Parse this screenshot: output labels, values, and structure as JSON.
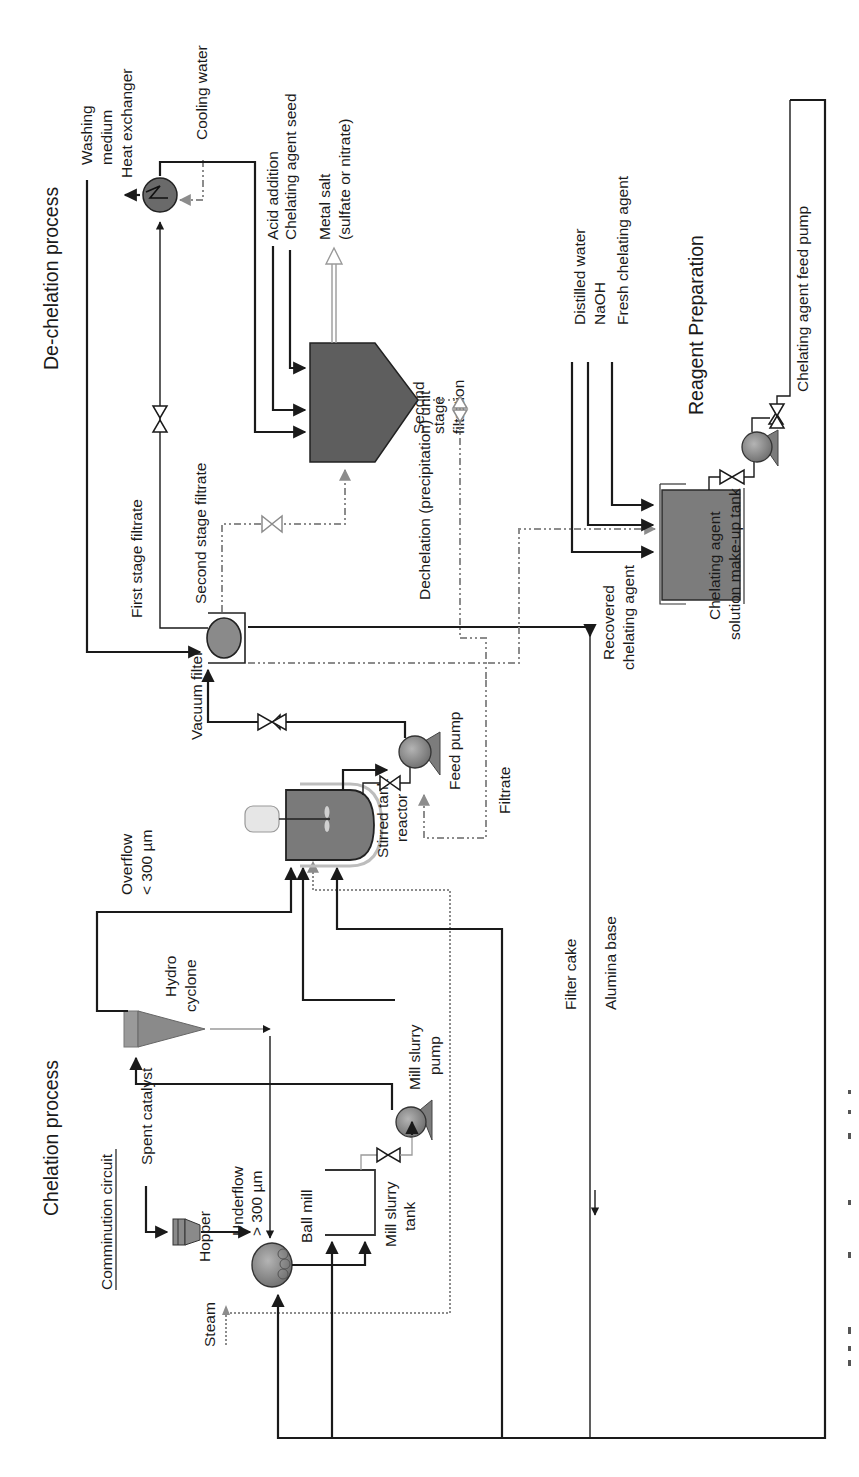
{
  "figure": {
    "orientation": "rotated-90-ccw",
    "sections": {
      "chelation_title": "Chelation process",
      "dechelation_title": "De-chelation process",
      "reagent_title": "Reagent Preparation",
      "comminution_title": "Comminution circuit"
    },
    "equipment": {
      "hopper": "Hopper",
      "ball_mill": "Ball mill",
      "mill_slurry_tank": [
        "Mill slurry",
        "tank"
      ],
      "mill_slurry_pump": [
        "Mill slurry",
        "pump"
      ],
      "hydro_cyclone": [
        "Hydro",
        "cyclone"
      ],
      "stirred_tank_reactor": [
        "Stirred tank",
        "reactor"
      ],
      "feed_pump": "Feed pump",
      "vacuum_filter": "Vacuum filter",
      "heat_exchanger": "Heat exchanger",
      "dechelation_unit": "Dechelation (precipitation) unit",
      "makeup_tank": [
        "Chelating agent",
        "solution make-up tank"
      ],
      "feed_pump_chelating": "Chelating agent feed pump"
    },
    "streams": {
      "spent_catalyst": "Spent catalyst",
      "steam": "Steam",
      "underflow": [
        "Underflow",
        "> 300 µm"
      ],
      "overflow": [
        "Overflow",
        "< 300 µm"
      ],
      "filtrate": "Filtrate",
      "filter_cake": "Filter cake",
      "alumina_base": "Alumina base",
      "washing_medium": [
        "Washing",
        "medium"
      ],
      "first_stage_filtrate": "First stage filtrate",
      "second_stage_filtrate": "Second stage filtrate",
      "second_stage_filtration": [
        "Second",
        "stage",
        "filtration"
      ],
      "recovered_chelating_agent": [
        "Recovered",
        "chelating agent"
      ],
      "cooling_water": "Cooling water",
      "acid_addition": "Acid addition",
      "chelating_agent_seed": "Chelating agent seed",
      "metal_salt": [
        "Metal salt",
        "(sulfate or nitrate)"
      ],
      "distilled_water": "Distilled water",
      "naoh": "NaOH",
      "fresh_chelating_agent": "Fresh chelating agent"
    },
    "caption_fragment": ""
  },
  "colors": {
    "line": "#1a1a1a",
    "secondary_line": "#8c8c8c",
    "vessel_fill": "#7c7c7c",
    "background": "#ffffff"
  }
}
